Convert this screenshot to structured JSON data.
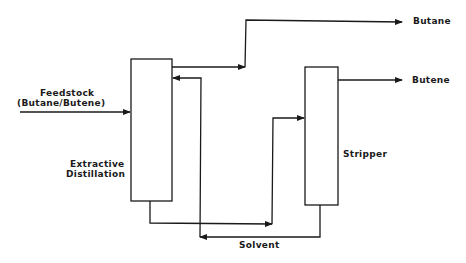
{
  "diagram": {
    "type": "process-flow",
    "units": [
      {
        "id": "extractive-distillation",
        "label_line1": "Extractive",
        "label_line2": "Distillation"
      },
      {
        "id": "stripper",
        "label": "Stripper"
      }
    ],
    "streams": {
      "feed_line1": "Feedstock",
      "feed_line2": "(Butane/Butene)",
      "butane": "Butane",
      "butene": "Butene",
      "solvent": "Solvent"
    },
    "line_color": "#1a1a1a",
    "background": "#ffffff"
  }
}
